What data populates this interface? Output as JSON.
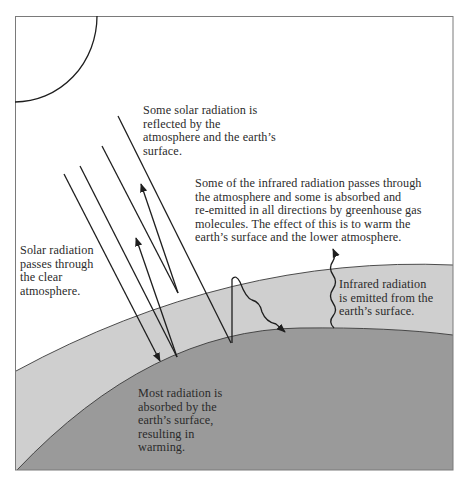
{
  "diagram": {
    "colors": {
      "sky": "#ffffff",
      "atmosphere": "#cfcfcf",
      "earth": "#9a9a9a",
      "line": "#1e1e1e",
      "frame": "#7a7a7a"
    },
    "labels": {
      "reflected": "Some solar radiation is\nreflected by the\natmosphere and the earth’s\nsurface.",
      "infrared_absorbed": "Some of the infrared radiation passes through\nthe atmosphere and some is absorbed and\nre-emitted in all directions by greenhouse gas\nmolecules. The effect of this is to warm the\nearth’s surface and the lower atmosphere.",
      "solar_passes": "Solar radiation\npasses through\nthe clear\natmosphere.",
      "infrared_emitted": "Infrared radiation\nis emitted from the\nearth’s surface.",
      "absorbed_surface": "Most radiation is\nabsorbed by the\nearth’s surface,\nresulting in\nwarming."
    },
    "elements": [
      "sun",
      "atmosphere-layer",
      "earth-surface",
      "incoming-solar-arrows",
      "reflected-arrows",
      "infrared-wavy-arrows"
    ]
  }
}
